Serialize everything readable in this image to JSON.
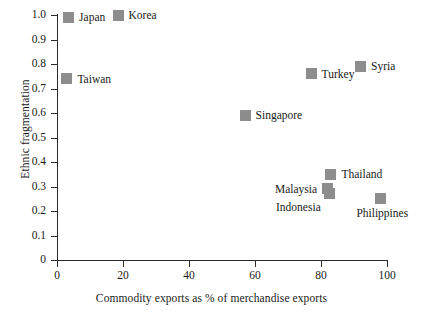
{
  "chart_data": {
    "type": "scatter",
    "title": "",
    "xlabel": "Commodity exports as % of merchandise exports",
    "ylabel": "Ethnic fragmentation",
    "xlim": [
      0,
      100
    ],
    "ylim": [
      0,
      1.0
    ],
    "grid": false,
    "legend": "none",
    "xticks": [
      "0",
      "20",
      "40",
      "60",
      "80",
      "100"
    ],
    "xtick_values": [
      0,
      20,
      40,
      60,
      80,
      100
    ],
    "yticks": [
      "0",
      "0.1",
      "0.2",
      "0.3",
      "0.4",
      "0.5",
      "0.6",
      "0.7",
      "0.8",
      "0.9",
      "1.0"
    ],
    "ytick_values": [
      0,
      0.1,
      0.2,
      0.3,
      0.4,
      0.5,
      0.6,
      0.7,
      0.8,
      0.9,
      1.0
    ],
    "marker_color": "#8d8d8d",
    "marker_shape": "square",
    "axis_color": "#2b2b2b",
    "background_color": "#ffffff",
    "points": [
      {
        "name": "Japan",
        "x": 3.5,
        "y": 0.99,
        "label_pos": "right"
      },
      {
        "name": "Korea",
        "x": 18.5,
        "y": 1.0,
        "label_pos": "right"
      },
      {
        "name": "Taiwan",
        "x": 3.0,
        "y": 0.74,
        "label_pos": "right"
      },
      {
        "name": "Turkey",
        "x": 77.0,
        "y": 0.76,
        "label_pos": "right"
      },
      {
        "name": "Syria",
        "x": 92.0,
        "y": 0.79,
        "label_pos": "right"
      },
      {
        "name": "Singapore",
        "x": 57.0,
        "y": 0.59,
        "label_pos": "right"
      },
      {
        "name": "Thailand",
        "x": 83.0,
        "y": 0.35,
        "label_pos": "right"
      },
      {
        "name": "Malaysia",
        "x": 82.0,
        "y": 0.29,
        "label_pos": "left"
      },
      {
        "name": "Indonesia",
        "x": 82.5,
        "y": 0.27,
        "label_pos": "below-left"
      },
      {
        "name": "Philippines",
        "x": 98.0,
        "y": 0.25,
        "label_pos": "below"
      }
    ]
  }
}
